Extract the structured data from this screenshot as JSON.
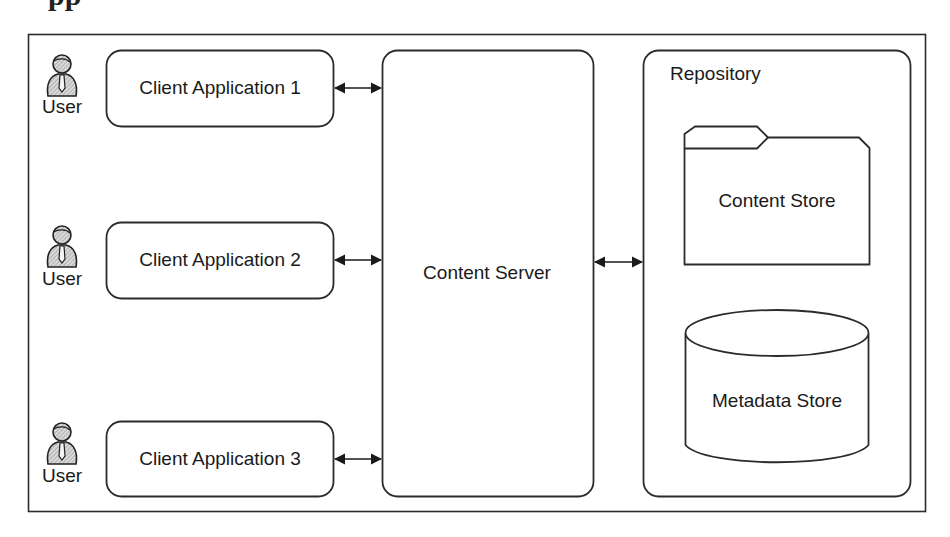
{
  "figure": {
    "clipped_heading_fragment": "pp"
  },
  "users": [
    {
      "label": "User",
      "icon": "user-with-tie-icon"
    },
    {
      "label": "User",
      "icon": "user-with-tie-icon"
    },
    {
      "label": "User",
      "icon": "user-with-tie-icon"
    }
  ],
  "clients": [
    {
      "label": "Client Application 1"
    },
    {
      "label": "Client Application 2"
    },
    {
      "label": "Client Application 3"
    }
  ],
  "server": {
    "label": "Content Server"
  },
  "repository": {
    "label": "Repository",
    "content_store": {
      "label": "Content Store",
      "shape": "folder-icon"
    },
    "metadata_store": {
      "label": "Metadata Store",
      "shape": "database-cylinder-icon"
    }
  },
  "connections": [
    {
      "from": "Client Application 1",
      "to": "Content Server",
      "type": "bidirectional"
    },
    {
      "from": "Client Application 2",
      "to": "Content Server",
      "type": "bidirectional"
    },
    {
      "from": "Client Application 3",
      "to": "Content Server",
      "type": "bidirectional"
    },
    {
      "from": "Content Server",
      "to": "Repository",
      "type": "bidirectional"
    }
  ],
  "colors": {
    "stroke": "#2b2b2b",
    "background": "#ffffff",
    "icon_fill": "#bdbdbd"
  }
}
